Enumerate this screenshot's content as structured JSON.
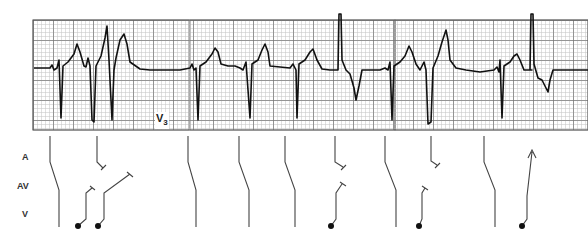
{
  "strip": {
    "lead_label": "V",
    "lead_number": "3",
    "grid": {
      "x": 33,
      "y": 20,
      "width": 156,
      "height": 110,
      "minor": 4,
      "major": 20,
      "minor_color": "#b9b9b9",
      "major_color": "#6e6e6e"
    },
    "baseline_y": 69,
    "trace_color": "#111111"
  },
  "ladder": {
    "rows": [
      {
        "label": "A",
        "y": 157
      },
      {
        "label": "AV",
        "y": 185
      },
      {
        "label": "V",
        "y": 213
      }
    ],
    "line_color": "#444444",
    "beats": [
      {
        "type": "conducted",
        "x": 50
      },
      {
        "type": "blocked_atrial",
        "x": 97
      },
      {
        "type": "ventricular_echo_short",
        "x": 78
      },
      {
        "type": "ventricular_echo_long",
        "x": 98
      },
      {
        "type": "conducted",
        "x": 195
      },
      {
        "type": "conducted",
        "x": 240
      },
      {
        "type": "conducted",
        "x": 286
      },
      {
        "type": "ventricular_bidirectional",
        "x": 335
      },
      {
        "type": "conducted",
        "x": 385
      },
      {
        "type": "ventricular_bidirectional",
        "x": 430
      },
      {
        "type": "conducted",
        "x": 484
      },
      {
        "type": "ventricular_retrograde_arrow",
        "x": 522
      }
    ]
  }
}
